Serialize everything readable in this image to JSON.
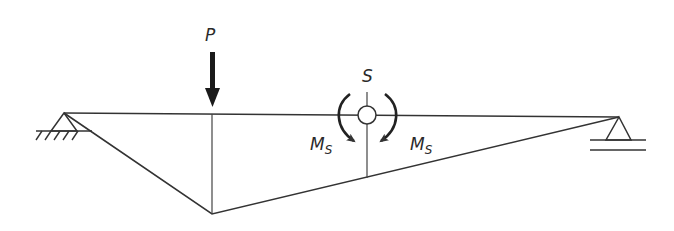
{
  "diagram": {
    "title": "",
    "labels": {
      "load": "P",
      "hinge": "S",
      "moment_left": "M",
      "moment_left_sub": "S",
      "moment_right": "M",
      "moment_right_sub": "S"
    },
    "colors": {
      "line": "#333333",
      "background": "#ffffff"
    },
    "elements": {
      "left_support": "fixed-pin-support",
      "right_support": "roller-support",
      "load": "point-load-arrow",
      "hinge": "internal-hinge",
      "moment_left": "clockwise-moment-arrow",
      "moment_right": "counterclockwise-moment-arrow",
      "moment_diagram": "triangular-influence-line"
    }
  }
}
